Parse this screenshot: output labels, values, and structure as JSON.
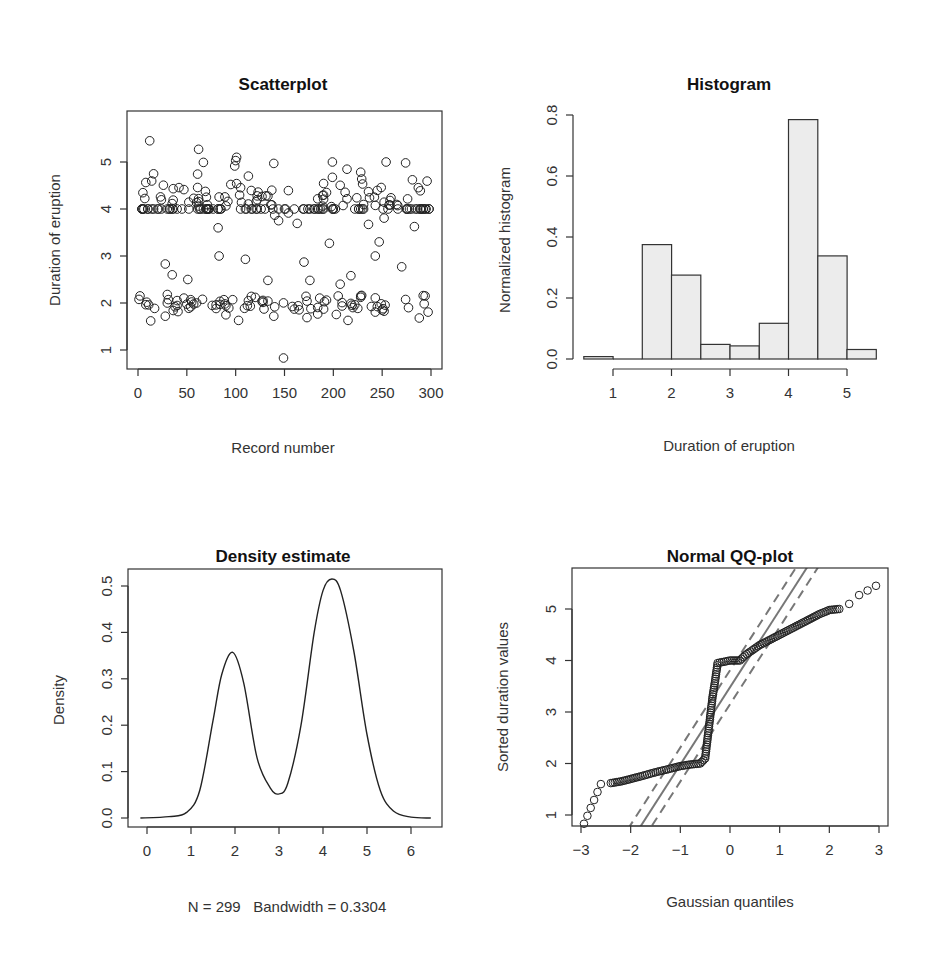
{
  "chart_data": [
    {
      "panel": "top-left",
      "type": "scatter",
      "title": "Scatterplot",
      "xlabel": "Record number",
      "ylabel": "Duration of eruption",
      "xlim": [
        0,
        300
      ],
      "ylim": [
        0.8,
        5.5
      ],
      "xticks": [
        "0",
        "50",
        "100",
        "150",
        "200",
        "250",
        "300"
      ],
      "yticks": [
        "1",
        "2",
        "3",
        "4",
        "5"
      ],
      "n_points": 299,
      "description": "Eruption duration by record number; bimodal bands near 2 and 4-5 minutes, with a dense row of values at exactly 4.0 and scattered points near 3; min ~0.83 at record ~149, max ~5.45 at record ~12",
      "points_sample": [
        [
          12,
          5.45
        ],
        [
          62,
          5.27
        ],
        [
          101,
          5.1
        ],
        [
          100,
          5.03
        ],
        [
          139,
          4.97
        ],
        [
          199,
          5.0
        ],
        [
          254,
          5.0
        ],
        [
          274,
          4.98
        ],
        [
          5,
          4.0
        ],
        [
          20,
          4.0
        ],
        [
          45,
          4.0
        ],
        [
          70,
          4.0
        ],
        [
          85,
          4.0
        ],
        [
          130,
          4.0
        ],
        [
          150,
          4.0
        ],
        [
          180,
          4.0
        ],
        [
          200,
          4.0
        ],
        [
          230,
          4.0
        ],
        [
          280,
          4.0
        ],
        [
          298,
          4.0
        ],
        [
          28,
          2.83
        ],
        [
          35,
          2.6
        ],
        [
          51,
          2.5
        ],
        [
          83,
          3.0
        ],
        [
          110,
          2.93
        ],
        [
          133,
          2.48
        ],
        [
          170,
          2.87
        ],
        [
          176,
          2.48
        ],
        [
          196,
          3.27
        ],
        [
          207,
          2.4
        ],
        [
          218,
          2.58
        ],
        [
          243,
          3.0
        ],
        [
          247,
          3.3
        ],
        [
          270,
          2.77
        ],
        [
          2,
          2.15
        ],
        [
          13,
          1.62
        ],
        [
          30,
          2.0
        ],
        [
          60,
          2.0
        ],
        [
          90,
          1.75
        ],
        [
          103,
          1.63
        ],
        [
          120,
          2.12
        ],
        [
          139,
          1.72
        ],
        [
          149,
          0.83
        ],
        [
          160,
          1.87
        ],
        [
          190,
          1.87
        ],
        [
          215,
          1.63
        ],
        [
          250,
          1.85
        ],
        [
          288,
          1.68
        ],
        [
          294,
          2.15
        ]
      ]
    },
    {
      "panel": "top-right",
      "type": "bar",
      "title": "Histogram",
      "xlabel": "Duration of eruption",
      "ylabel": "Normalized histogram",
      "bin_edges": [
        0.5,
        1.0,
        1.5,
        2.0,
        2.5,
        3.0,
        3.5,
        4.0,
        4.5,
        5.0,
        5.5
      ],
      "categories": [
        "0.5-1.0",
        "1.0-1.5",
        "1.5-2.0",
        "2.0-2.5",
        "2.5-3.0",
        "3.0-3.5",
        "3.5-4.0",
        "4.0-4.5",
        "4.5-5.0",
        "5.0-5.5"
      ],
      "values": [
        0.008,
        0.0,
        0.375,
        0.275,
        0.048,
        0.043,
        0.117,
        0.785,
        0.338,
        0.031
      ],
      "xticks": [
        "1",
        "2",
        "3",
        "4",
        "5"
      ],
      "yticks": [
        "0.0",
        "0.2",
        "0.4",
        "0.6",
        "0.8"
      ],
      "ylim": [
        0,
        0.8
      ]
    },
    {
      "panel": "bottom-left",
      "type": "line",
      "title": "Density estimate",
      "xlabel": "N = 299   Bandwidth = 0.3304",
      "ylabel": "Density",
      "xlim": [
        -0.2,
        6.5
      ],
      "ylim": [
        0,
        0.52
      ],
      "xticks": [
        "0",
        "1",
        "2",
        "3",
        "4",
        "5",
        "6"
      ],
      "yticks": [
        "0.0",
        "0.1",
        "0.2",
        "0.3",
        "0.4",
        "0.5"
      ],
      "x": [
        -0.15,
        0.5,
        0.9,
        1.2,
        1.5,
        1.7,
        1.95,
        2.2,
        2.5,
        2.8,
        3.0,
        3.2,
        3.5,
        3.8,
        4.0,
        4.2,
        4.4,
        4.7,
        5.0,
        5.3,
        5.6,
        6.0,
        6.45
      ],
      "y": [
        0.0,
        0.003,
        0.012,
        0.06,
        0.21,
        0.31,
        0.357,
        0.29,
        0.13,
        0.065,
        0.052,
        0.075,
        0.2,
        0.4,
        0.49,
        0.515,
        0.49,
        0.36,
        0.18,
        0.06,
        0.015,
        0.002,
        0.0
      ],
      "annotation": {
        "n": "N = 299",
        "bandwidth": "Bandwidth = 0.3304"
      }
    },
    {
      "panel": "bottom-right",
      "type": "scatter",
      "title": "Normal QQ-plot",
      "xlabel": "Gaussian quantiles",
      "ylabel": "Sorted duration values",
      "xlim": [
        -3.05,
        3.1
      ],
      "ylim": [
        0.65,
        5.6
      ],
      "xticks": [
        "−3",
        "−2",
        "−1",
        "0",
        "1",
        "2",
        "3"
      ],
      "yticks": [
        "1",
        "2",
        "3",
        "4",
        "5"
      ],
      "reference_line": {
        "slope": 1.5,
        "intercept": 3.48,
        "style": "solid gray"
      },
      "confidence_band": {
        "offset": 0.33,
        "style": "dashed gray"
      },
      "quantiles_x": [
        -2.94,
        -2.6,
        -2.4,
        -2.2,
        -2.0,
        -1.8,
        -1.5,
        -1.2,
        -1.0,
        -0.8,
        -0.6,
        -0.5,
        -0.45,
        -0.4,
        -0.35,
        -0.3,
        -0.25,
        0.0,
        0.2,
        0.3,
        0.6,
        0.9,
        1.2,
        1.5,
        1.8,
        2.0,
        2.2,
        2.4,
        2.6,
        2.94
      ],
      "quantiles_y": [
        0.83,
        1.6,
        1.62,
        1.65,
        1.7,
        1.75,
        1.83,
        1.9,
        1.95,
        1.98,
        2.0,
        2.1,
        2.5,
        2.9,
        3.3,
        3.6,
        3.95,
        4.0,
        4.0,
        4.1,
        4.3,
        4.45,
        4.6,
        4.75,
        4.9,
        4.98,
        5.0,
        5.1,
        5.27,
        5.45
      ]
    }
  ]
}
